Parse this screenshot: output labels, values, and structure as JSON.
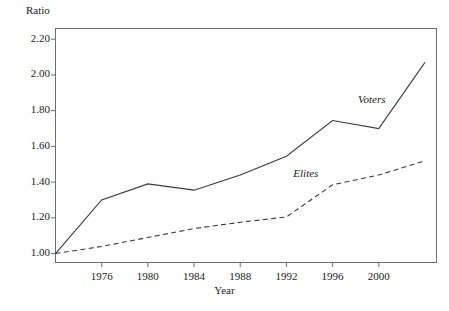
{
  "chart_data": {
    "type": "line",
    "title": "",
    "xlabel": "Year",
    "ylabel": "Ratio",
    "x": [
      1972,
      1976,
      1980,
      1984,
      1988,
      1992,
      1996,
      2000,
      2004
    ],
    "xtick_labels": [
      "1976",
      "1980",
      "1984",
      "1988",
      "1992",
      "1996",
      "2000"
    ],
    "xticks": [
      1976,
      1980,
      1984,
      1988,
      1992,
      1996,
      2000
    ],
    "ytick_labels": [
      "1.00",
      "1.20",
      "1.40",
      "1.60",
      "1.80",
      "2.00",
      "2.20"
    ],
    "yticks": [
      1.0,
      1.2,
      1.4,
      1.6,
      1.8,
      2.0,
      2.2
    ],
    "xlim": [
      1972,
      2005
    ],
    "ylim": [
      0.95,
      2.26
    ],
    "grid": false,
    "legend": "inline-annotations",
    "series": [
      {
        "name": "Voters",
        "style": "solid",
        "color": "#3a3a3a",
        "values": [
          1.0,
          1.3,
          1.39,
          1.355,
          1.44,
          1.545,
          1.745,
          1.7,
          2.07
        ]
      },
      {
        "name": "Elites",
        "style": "dashed",
        "color": "#3a3a3a",
        "values": [
          1.0,
          1.04,
          1.09,
          1.14,
          1.175,
          1.205,
          1.385,
          1.44,
          1.52
        ]
      }
    ],
    "annotations": [
      {
        "text": "Voters",
        "x": 1998.2,
        "y": 1.855
      },
      {
        "text": "Elites",
        "x": 1992.6,
        "y": 1.44
      }
    ]
  },
  "figure": {
    "frame_color": "#6e6e6e",
    "background": "#ffffff"
  }
}
